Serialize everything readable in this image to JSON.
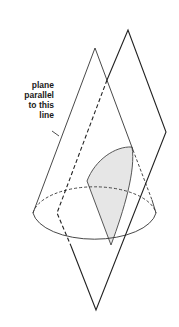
{
  "diagram": {
    "annotation": {
      "lines": [
        "plane",
        "parallel",
        "to this",
        "line"
      ]
    },
    "elements": {
      "cone": "right circular cone, apex up",
      "plane": "cutting plane parallel to cone generator",
      "section": "shaded parabolic region"
    },
    "colors": {
      "stroke": "#222222",
      "shade": "#e6e6e6",
      "background": "#ffffff"
    }
  }
}
